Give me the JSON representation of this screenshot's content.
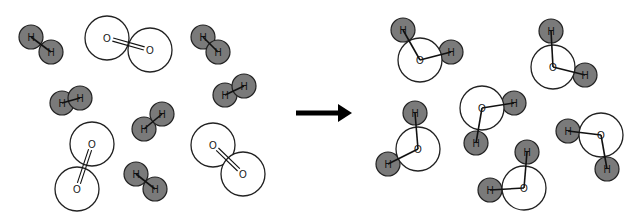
{
  "diagram": {
    "type": "chemical-reaction-molecular-model",
    "reactants_label": "reactants",
    "products_label": "products",
    "colors": {
      "hydrogen_fill": "#7a7a7a",
      "hydrogen_stroke": "#222222",
      "oxygen_fill": "#ffffff",
      "oxygen_stroke": "#222222",
      "bond": "#111111",
      "arrow": "#000000",
      "background": "#ffffff"
    },
    "radii": {
      "hydrogen": 12,
      "oxygen": 22
    },
    "atom_labels": {
      "hydrogen": "H",
      "oxygen": "O"
    },
    "reactants": {
      "h2": [
        {
          "atoms": [
            [
              31,
              37
            ],
            [
              51,
              52
            ]
          ]
        },
        {
          "atoms": [
            [
              62,
              103
            ],
            [
              80,
              98
            ]
          ]
        },
        {
          "atoms": [
            [
              203,
              37
            ],
            [
              218,
              52
            ]
          ]
        },
        {
          "atoms": [
            [
              225,
              95
            ],
            [
              244,
              86
            ]
          ]
        },
        {
          "atoms": [
            [
              144,
              129
            ],
            [
              162,
              114
            ]
          ]
        },
        {
          "atoms": [
            [
              136,
              174
            ],
            [
              155,
              189
            ]
          ]
        }
      ],
      "o2": [
        {
          "atoms": [
            [
              107,
              38
            ],
            [
              150,
              50
            ]
          ]
        },
        {
          "atoms": [
            [
              92,
              144
            ],
            [
              77,
              189
            ]
          ]
        },
        {
          "atoms": [
            [
              213,
              145
            ],
            [
              243,
              174
            ]
          ]
        }
      ]
    },
    "arrow": {
      "x1": 296,
      "y1": 113,
      "x2": 352,
      "y2": 113
    },
    "products": {
      "h2o": [
        {
          "o": [
            420,
            60
          ],
          "h": [
            [
              403,
              30
            ],
            [
              451,
              52
            ]
          ]
        },
        {
          "o": [
            553,
            67
          ],
          "h": [
            [
              551,
              31
            ],
            [
              585,
              75
            ]
          ]
        },
        {
          "o": [
            482,
            108
          ],
          "h": [
            [
              514,
              103
            ],
            [
              476,
              143
            ]
          ]
        },
        {
          "o": [
            418,
            149
          ],
          "h": [
            [
              415,
              113
            ],
            [
              388,
              164
            ]
          ]
        },
        {
          "o": [
            601,
            135
          ],
          "h": [
            [
              568,
              131
            ],
            [
              607,
              169
            ]
          ]
        },
        {
          "o": [
            524,
            188
          ],
          "h": [
            [
              527,
              152
            ],
            [
              490,
              190
            ]
          ]
        }
      ]
    },
    "counts": {
      "h2": 6,
      "o2": 3,
      "h2o": 6
    }
  }
}
